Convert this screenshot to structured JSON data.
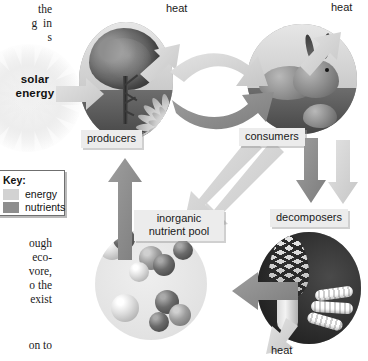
{
  "figure": {
    "type": "ecosystem-energy-nutrient-cycle-diagram",
    "solar_label": "solar\nenergy",
    "solar_label_line1": "solar",
    "solar_label_line2": "energy"
  },
  "key": {
    "title": "Key:",
    "items": [
      {
        "label": "energy",
        "color": "#d2d2d2"
      },
      {
        "label": "nutrients",
        "color": "#8e8e8e"
      }
    ]
  },
  "nodes": [
    {
      "id": "producers",
      "label": "producers"
    },
    {
      "id": "consumers",
      "label": "consumers"
    },
    {
      "id": "decomposers",
      "label": "decomposers"
    },
    {
      "id": "pool",
      "label": "inorganic nutrient pool"
    }
  ],
  "heat_labels": [
    {
      "id": "heat-top-left",
      "label": "heat"
    },
    {
      "id": "heat-top-right",
      "label": "heat"
    },
    {
      "id": "heat-bottom",
      "label": "heat"
    }
  ],
  "body_text": {
    "column_top": "the\ng  in\ns",
    "column_middle": "ough\neco-\nvore,\no the\nexist",
    "column_bottom": "on to"
  },
  "colors": {
    "energy_arrow": "#d2d2d2",
    "nutrient_arrow": "#8e8e8e",
    "label_background": "#ececec",
    "page_background": "#ffffff",
    "text": "#1a1a1a"
  }
}
